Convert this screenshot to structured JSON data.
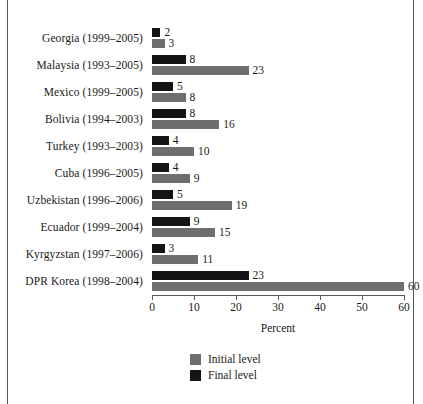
{
  "chart_data": {
    "type": "bar",
    "orientation": "horizontal",
    "title": "",
    "xlabel": "Percent",
    "ylabel": "",
    "xlim": [
      0,
      60
    ],
    "xticks": [
      0,
      10,
      20,
      30,
      40,
      50,
      60
    ],
    "xtick_labels": [
      "0",
      "10",
      "20",
      "30",
      "40",
      "50",
      "60"
    ],
    "grid": false,
    "legend_position": "bottom-center",
    "categories": [
      "Georgia (1999–2005)",
      "Malaysia (1993–2005)",
      "Mexico (1999–2005)",
      "Bolivia (1994–2003)",
      "Turkey (1993–2003)",
      "Cuba (1996–2005)",
      "Uzbekistan (1996–2006)",
      "Ecuador (1999–2004)",
      "Kyrgyzstan (1997–2006)",
      "DPR Korea (1998–2004)"
    ],
    "series": [
      {
        "name": "Final level",
        "color": "#141414",
        "values": [
          2,
          8,
          5,
          8,
          4,
          4,
          5,
          9,
          3,
          23
        ]
      },
      {
        "name": "Initial level",
        "color": "#6e6e6e",
        "values": [
          3,
          23,
          8,
          16,
          10,
          9,
          19,
          15,
          11,
          60
        ]
      }
    ]
  },
  "legend": {
    "items": [
      {
        "label": "Initial level",
        "swatch": "initial"
      },
      {
        "label": "Final level",
        "swatch": "final"
      }
    ]
  },
  "axis": {
    "title": "Percent"
  }
}
